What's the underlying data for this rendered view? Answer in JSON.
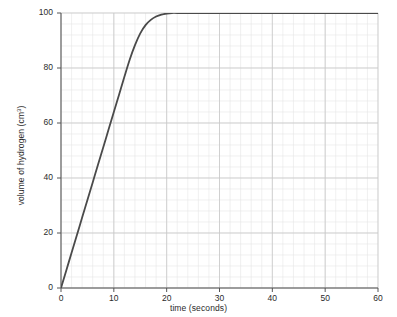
{
  "chart_data": {
    "type": "line",
    "title": "",
    "xlabel": "time (seconds)",
    "ylabel": "volume of hydrogen (cm³)",
    "ylabel_text": "volume of hydrogen (cm",
    "ylabel_sup": "3",
    "ylabel_tail": ")",
    "xlim": [
      0,
      60
    ],
    "ylim": [
      0,
      100
    ],
    "xticks": [
      0,
      10,
      20,
      30,
      40,
      50,
      60
    ],
    "yticks": [
      0,
      20,
      40,
      60,
      80,
      100
    ],
    "xtick_labels": [
      "0",
      "10",
      "20",
      "30",
      "40",
      "50",
      "60"
    ],
    "ytick_labels": [
      "0",
      "20",
      "40",
      "60",
      "80",
      "100"
    ],
    "grid": true,
    "minor_grid": true,
    "minor_grid_divisions": 5,
    "legend": null,
    "line_color": "#4a4a4a",
    "line_width": 1.8,
    "grid_major_color": "#c8c8c8",
    "grid_minor_color": "#e6e6e6",
    "axis_color": "#555555",
    "background": "#ffffff",
    "series": [
      {
        "name": "volume of hydrogen",
        "x": [
          0,
          1,
          2,
          3,
          4,
          5,
          6,
          7,
          8,
          9,
          10,
          11,
          12,
          13,
          14,
          15,
          16,
          17,
          18,
          19,
          20,
          21,
          22,
          25,
          30,
          35,
          40,
          45,
          50,
          55,
          60
        ],
        "y": [
          0,
          6.4,
          12.8,
          19.2,
          25.6,
          32.0,
          38.4,
          44.8,
          51.2,
          57.6,
          64.0,
          70.4,
          76.8,
          83.0,
          88.3,
          92.6,
          95.6,
          97.5,
          98.7,
          99.4,
          99.8,
          100.0,
          100.0,
          100.0,
          100.0,
          100.0,
          100.0,
          100.0,
          100.0,
          100.0,
          100.0
        ]
      }
    ],
    "annotations": []
  },
  "watermark": {
    "text": ""
  }
}
